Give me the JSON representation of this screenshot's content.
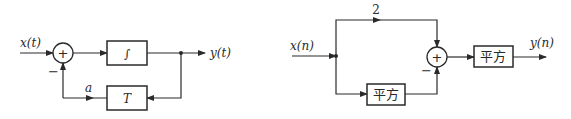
{
  "diagram_left": {
    "input_label": "x(t)",
    "output_label": "y(t)",
    "sum_symbol": "+",
    "feedback_sign": "−",
    "forward_block": "∫",
    "feedback_block": "T",
    "feedback_gain_label": "a"
  },
  "diagram_right": {
    "input_label": "x(n)",
    "output_label": "y(n)",
    "upper_branch_gain": "2",
    "sum_symbol": "+",
    "lower_sign": "−",
    "lower_block": "平方",
    "output_block": "平方"
  }
}
